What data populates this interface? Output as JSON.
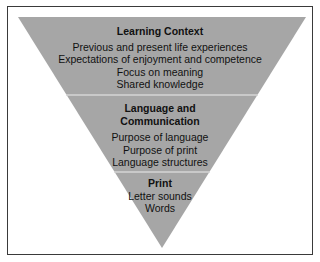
{
  "diagram": {
    "type": "inverted-pyramid",
    "colors": {
      "fill": "#a6a6a6",
      "divider": "#d4d4d4",
      "border": "#3a3a3a",
      "text": "#111111"
    },
    "levels": [
      {
        "title": "Learning Context",
        "items": [
          "Previous and present life experiences",
          "Expectations of enjoyment and competence",
          "Focus on meaning",
          "Shared knowledge"
        ]
      },
      {
        "title_lines": [
          "Language and",
          "Communication"
        ],
        "items": [
          "Purpose of language",
          "Purpose of print",
          "Language structures"
        ]
      },
      {
        "title": "Print",
        "items": [
          "Letter sounds",
          "Words"
        ]
      }
    ]
  }
}
